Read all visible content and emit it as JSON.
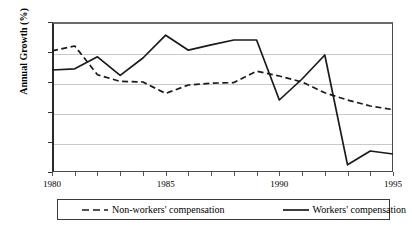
{
  "chart_data": {
    "type": "line",
    "title": "",
    "xlabel": "",
    "ylabel": "Annual Growth (%)",
    "xlim": [
      1980,
      1995
    ],
    "ylim": [
      -5,
      20
    ],
    "grid": true,
    "legend_position": "bottom",
    "x": [
      1980,
      1981,
      1982,
      1983,
      1984,
      1985,
      1986,
      1987,
      1988,
      1989,
      1990,
      1991,
      1992,
      1993,
      1994,
      1995
    ],
    "y_tick_labels": [
      "20%",
      "15%",
      "10%",
      "5%",
      "0%",
      "-5%"
    ],
    "y_tick_values": [
      20,
      15,
      10,
      5,
      0,
      -5
    ],
    "x_tick_labels": [
      "1980",
      "1985",
      "1990",
      "1995"
    ],
    "x_tick_values": [
      1980,
      1985,
      1990,
      1995
    ],
    "series": [
      {
        "name": "Non-workers' compensation",
        "style": "dashed",
        "color": "#1a1a1a",
        "values": [
          15.2,
          16.0,
          11.2,
          10.1,
          10.0,
          8.1,
          9.5,
          9.8,
          9.9,
          11.8,
          11.0,
          10.0,
          8.2,
          7.0,
          6.0,
          5.4
        ]
      },
      {
        "name": "Workers' compensation",
        "style": "solid",
        "color": "#1a1a1a",
        "values": [
          12.0,
          12.2,
          14.2,
          11.1,
          14.0,
          17.8,
          15.3,
          16.2,
          17.0,
          17.0,
          7.0,
          10.5,
          14.5,
          -3.8,
          -1.5,
          -2.0
        ]
      }
    ]
  },
  "axes": {
    "y_title": "Annual Growth (%)"
  },
  "legend": {
    "items": [
      {
        "label": "Non-workers' compensation",
        "style": "dashed"
      },
      {
        "label": "Workers' compensation",
        "style": "solid"
      }
    ]
  }
}
